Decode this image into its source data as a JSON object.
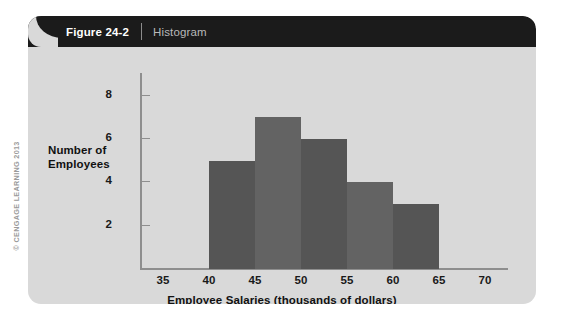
{
  "figure": {
    "number_label": "Figure 24-2",
    "caption": "Histogram"
  },
  "copyright": "© CENGAGE LEARNING 2013",
  "colors": {
    "panel_background": "#d9d9d9",
    "header_background": "#1b1b1b",
    "axis": "#8e8e8e",
    "bar_dark": "#555555",
    "bar_light": "#636363",
    "text": "#111111"
  },
  "chart_data": {
    "type": "bar",
    "title": "Histogram",
    "xlabel": "Employee Salaries (thousands of dollars)",
    "ylabel": "Number of Employees",
    "ylabel_lines": [
      "Number of",
      "Employees"
    ],
    "categories": [
      "40-45",
      "45-50",
      "50-55",
      "55-60",
      "60-65"
    ],
    "bin_edges": [
      40,
      45,
      50,
      55,
      60,
      65
    ],
    "values": [
      5,
      7,
      6,
      4,
      3
    ],
    "bar_colors": [
      "#555555",
      "#636363",
      "#555555",
      "#636363",
      "#555555"
    ],
    "xlim": [
      32.5,
      72.5
    ],
    "ylim": [
      0,
      9
    ],
    "xticks": [
      35,
      40,
      45,
      50,
      55,
      60,
      65,
      70
    ],
    "xtick_labels": [
      "35",
      "40",
      "45",
      "50",
      "55",
      "60",
      "65",
      "70"
    ],
    "yticks": [
      2,
      4,
      6,
      8
    ],
    "ytick_labels": [
      "2",
      "4",
      "6",
      "8"
    ],
    "grid": false,
    "legend": null
  }
}
